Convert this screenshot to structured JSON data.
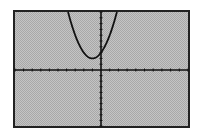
{
  "chart_data": {
    "type": "line",
    "title": "",
    "xlabel": "",
    "ylabel": "",
    "xlim": [
      -10,
      10
    ],
    "ylim": [
      -10,
      10
    ],
    "xscl": 1,
    "yscl": 1,
    "grid": false,
    "legend": null,
    "series": [
      {
        "name": "Y1",
        "equation": "y = x^2 + 2x + 3",
        "x": [
          -3.8,
          -3,
          -2,
          -1,
          0,
          1,
          1.8
        ],
        "y": [
          10.8,
          6,
          3,
          2,
          3,
          6,
          9.8
        ]
      }
    ],
    "vertex": [
      -1,
      2
    ]
  },
  "screen": {
    "background": "#c4c4c4",
    "pattern": "#a8a8a8",
    "frame_color": "#222222",
    "axis_color": "#111111",
    "curve_color": "#111111"
  }
}
